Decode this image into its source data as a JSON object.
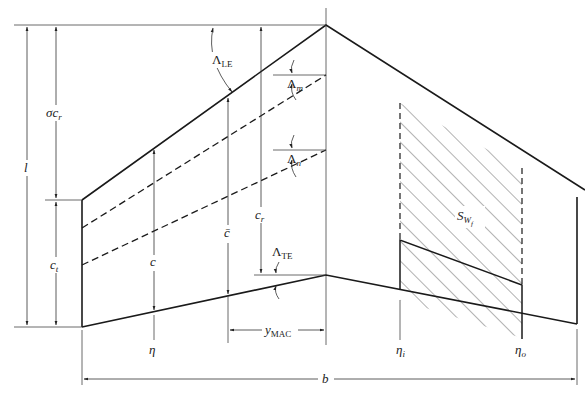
{
  "diagram": {
    "colors": {
      "line": "#1a1a1a",
      "dim": "#333333",
      "hatch": "#555555",
      "background": "#ffffff"
    },
    "labels": {
      "lambda_le": {
        "symbol": "Λ",
        "sub": "LE"
      },
      "lambda_m": {
        "symbol": "Λ",
        "sub": "m"
      },
      "lambda_n": {
        "symbol": "Λ",
        "sub": "n"
      },
      "lambda_te": {
        "symbol": "Λ",
        "sub": "TE"
      },
      "sigma_ct": {
        "symbol": "σc",
        "sub": "r"
      },
      "l": {
        "symbol": "l"
      },
      "c_t": {
        "symbol": "c",
        "sub": "t"
      },
      "c": {
        "symbol": "c"
      },
      "c_bar": {
        "symbol": "c̄"
      },
      "c_r": {
        "symbol": "c",
        "sub": "r"
      },
      "s_wf": {
        "symbol": "S",
        "sub": "W",
        "subsub": "f"
      },
      "eta": {
        "symbol": "η"
      },
      "y_mac": {
        "symbol": "y",
        "sub": "MAC"
      },
      "eta_i": {
        "symbol": "η",
        "sub": "i"
      },
      "eta_o": {
        "symbol": "η",
        "sub": "o"
      },
      "b": {
        "symbol": "b"
      }
    }
  }
}
